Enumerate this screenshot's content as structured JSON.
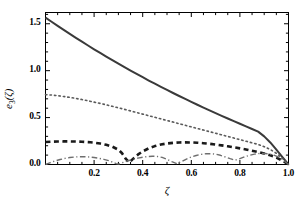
{
  "chart_data": {
    "type": "line",
    "title": "",
    "xlabel": "ζ",
    "ylabel": "e₃(ζ)",
    "xlim": [
      0.0,
      1.0
    ],
    "ylim": [
      0.0,
      1.62
    ],
    "xticks": [
      0.0,
      0.2,
      0.4,
      0.6,
      0.8,
      1.0
    ],
    "xtick_labels": [
      "",
      "0.2",
      "0.4",
      "0.6",
      "0.8",
      "1.0"
    ],
    "yticks": [
      0.0,
      0.5,
      1.0,
      1.5
    ],
    "ytick_labels": [
      "0.0",
      "0.5",
      "1.0",
      "1.5"
    ],
    "minor_ticks": true,
    "grid": false,
    "legend": "none",
    "frame": true,
    "background": "#ffffff",
    "axis_color": "#000000",
    "series": [
      {
        "name": "solid",
        "style": "solid",
        "color": "#3a3a3a",
        "width": 2.0,
        "x": [
          0.0,
          0.025,
          0.05,
          0.075,
          0.1,
          0.125,
          0.15,
          0.175,
          0.2,
          0.225,
          0.25,
          0.275,
          0.3,
          0.325,
          0.35,
          0.375,
          0.4,
          0.425,
          0.45,
          0.475,
          0.5,
          0.525,
          0.55,
          0.575,
          0.6,
          0.625,
          0.65,
          0.675,
          0.7,
          0.725,
          0.75,
          0.775,
          0.8,
          0.825,
          0.85,
          0.875,
          0.9,
          0.925,
          0.95,
          0.975,
          1.0
        ],
        "y": [
          1.565,
          1.521,
          1.477,
          1.434,
          1.392,
          1.35,
          1.309,
          1.268,
          1.228,
          1.189,
          1.15,
          1.112,
          1.074,
          1.037,
          1.001,
          0.965,
          0.93,
          0.895,
          0.861,
          0.828,
          0.795,
          0.762,
          0.73,
          0.699,
          0.668,
          0.637,
          0.607,
          0.577,
          0.548,
          0.519,
          0.49,
          0.462,
          0.434,
          0.406,
          0.378,
          0.35,
          0.3,
          0.235,
          0.158,
          0.079,
          0.0
        ]
      },
      {
        "name": "dotted",
        "style": "dotted",
        "color": "#5a5a5a",
        "width": 1.6,
        "x": [
          0.0,
          0.025,
          0.05,
          0.075,
          0.1,
          0.125,
          0.15,
          0.175,
          0.2,
          0.225,
          0.25,
          0.275,
          0.3,
          0.325,
          0.35,
          0.375,
          0.4,
          0.425,
          0.45,
          0.475,
          0.5,
          0.525,
          0.55,
          0.575,
          0.6,
          0.625,
          0.65,
          0.675,
          0.7,
          0.725,
          0.75,
          0.775,
          0.8,
          0.825,
          0.85,
          0.875,
          0.9,
          0.925,
          0.95,
          0.975,
          1.0
        ],
        "y": [
          0.745,
          0.74,
          0.733,
          0.725,
          0.715,
          0.704,
          0.692,
          0.679,
          0.665,
          0.651,
          0.636,
          0.62,
          0.604,
          0.588,
          0.571,
          0.554,
          0.537,
          0.52,
          0.503,
          0.486,
          0.469,
          0.452,
          0.435,
          0.418,
          0.401,
          0.384,
          0.367,
          0.35,
          0.333,
          0.316,
          0.299,
          0.282,
          0.265,
          0.248,
          0.231,
          0.214,
          0.19,
          0.16,
          0.12,
          0.066,
          0.0
        ]
      },
      {
        "name": "dashed",
        "style": "dashed",
        "color": "#1a1a1a",
        "width": 2.6,
        "x": [
          0.0,
          0.025,
          0.05,
          0.075,
          0.1,
          0.125,
          0.15,
          0.175,
          0.2,
          0.225,
          0.25,
          0.275,
          0.3,
          0.315,
          0.33,
          0.345,
          0.36,
          0.38,
          0.4,
          0.425,
          0.45,
          0.475,
          0.5,
          0.525,
          0.55,
          0.575,
          0.6,
          0.625,
          0.65,
          0.675,
          0.7,
          0.725,
          0.75,
          0.775,
          0.8,
          0.825,
          0.85,
          0.875,
          0.9,
          0.925,
          0.95,
          0.975,
          1.0
        ],
        "y": [
          0.24,
          0.243,
          0.245,
          0.246,
          0.246,
          0.245,
          0.243,
          0.239,
          0.233,
          0.224,
          0.21,
          0.19,
          0.158,
          0.12,
          0.062,
          0.022,
          0.06,
          0.105,
          0.14,
          0.172,
          0.196,
          0.213,
          0.224,
          0.231,
          0.235,
          0.236,
          0.235,
          0.232,
          0.227,
          0.221,
          0.213,
          0.204,
          0.194,
          0.183,
          0.172,
          0.16,
          0.147,
          0.133,
          0.117,
          0.098,
          0.074,
          0.041,
          0.0
        ]
      },
      {
        "name": "dash-dot",
        "style": "dashdot",
        "color": "#6e6e6e",
        "width": 1.4,
        "x": [
          0.0,
          0.02,
          0.04,
          0.06,
          0.08,
          0.1,
          0.12,
          0.14,
          0.16,
          0.18,
          0.2,
          0.22,
          0.24,
          0.26,
          0.28,
          0.29,
          0.3,
          0.32,
          0.34,
          0.36,
          0.38,
          0.4,
          0.42,
          0.44,
          0.46,
          0.48,
          0.5,
          0.52,
          0.54,
          0.56,
          0.58,
          0.6,
          0.62,
          0.64,
          0.66,
          0.68,
          0.7,
          0.72,
          0.74,
          0.76,
          0.78,
          0.8,
          0.82,
          0.84,
          0.86,
          0.88,
          0.9,
          0.92,
          0.94,
          0.96,
          0.98,
          1.0
        ],
        "y": [
          0.0,
          0.02,
          0.038,
          0.053,
          0.065,
          0.074,
          0.08,
          0.083,
          0.083,
          0.08,
          0.074,
          0.066,
          0.055,
          0.041,
          0.022,
          0.01,
          0.004,
          0.022,
          0.04,
          0.055,
          0.068,
          0.078,
          0.085,
          0.088,
          0.086,
          0.076,
          0.056,
          0.03,
          0.01,
          0.03,
          0.058,
          0.08,
          0.096,
          0.108,
          0.114,
          0.115,
          0.11,
          0.098,
          0.08,
          0.062,
          0.046,
          0.062,
          0.082,
          0.098,
          0.11,
          0.117,
          0.118,
          0.113,
          0.1,
          0.078,
          0.044,
          0.0
        ]
      }
    ]
  },
  "axes": {
    "x_title": "ζ",
    "y_title_main": "e",
    "y_title_sub": "3",
    "y_title_arg": "(ζ)"
  }
}
